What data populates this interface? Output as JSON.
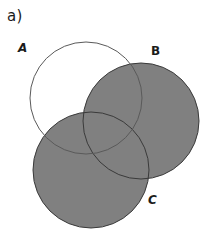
{
  "figure": {
    "panel_label": "a)",
    "background_color": "#ffffff",
    "width": 210,
    "height": 246,
    "stroke_color": "#3a3a3a",
    "stroke_width": 1,
    "fill_color": "#808080"
  },
  "sets": [
    {
      "id": "A",
      "label": "A",
      "filled": false,
      "fill_color": "none",
      "cx": 86,
      "cy": 98,
      "r": 56,
      "label_x": 18,
      "label_y": 42
    },
    {
      "id": "B",
      "label": "B",
      "filled": true,
      "fill_color": "#808080",
      "cx": 141,
      "cy": 121,
      "r": 58,
      "label_x": 151,
      "label_y": 45
    },
    {
      "id": "C",
      "label": "C",
      "filled": true,
      "fill_color": "#808080",
      "cx": 91,
      "cy": 170,
      "r": 58,
      "label_x": 148,
      "label_y": 194
    }
  ]
}
